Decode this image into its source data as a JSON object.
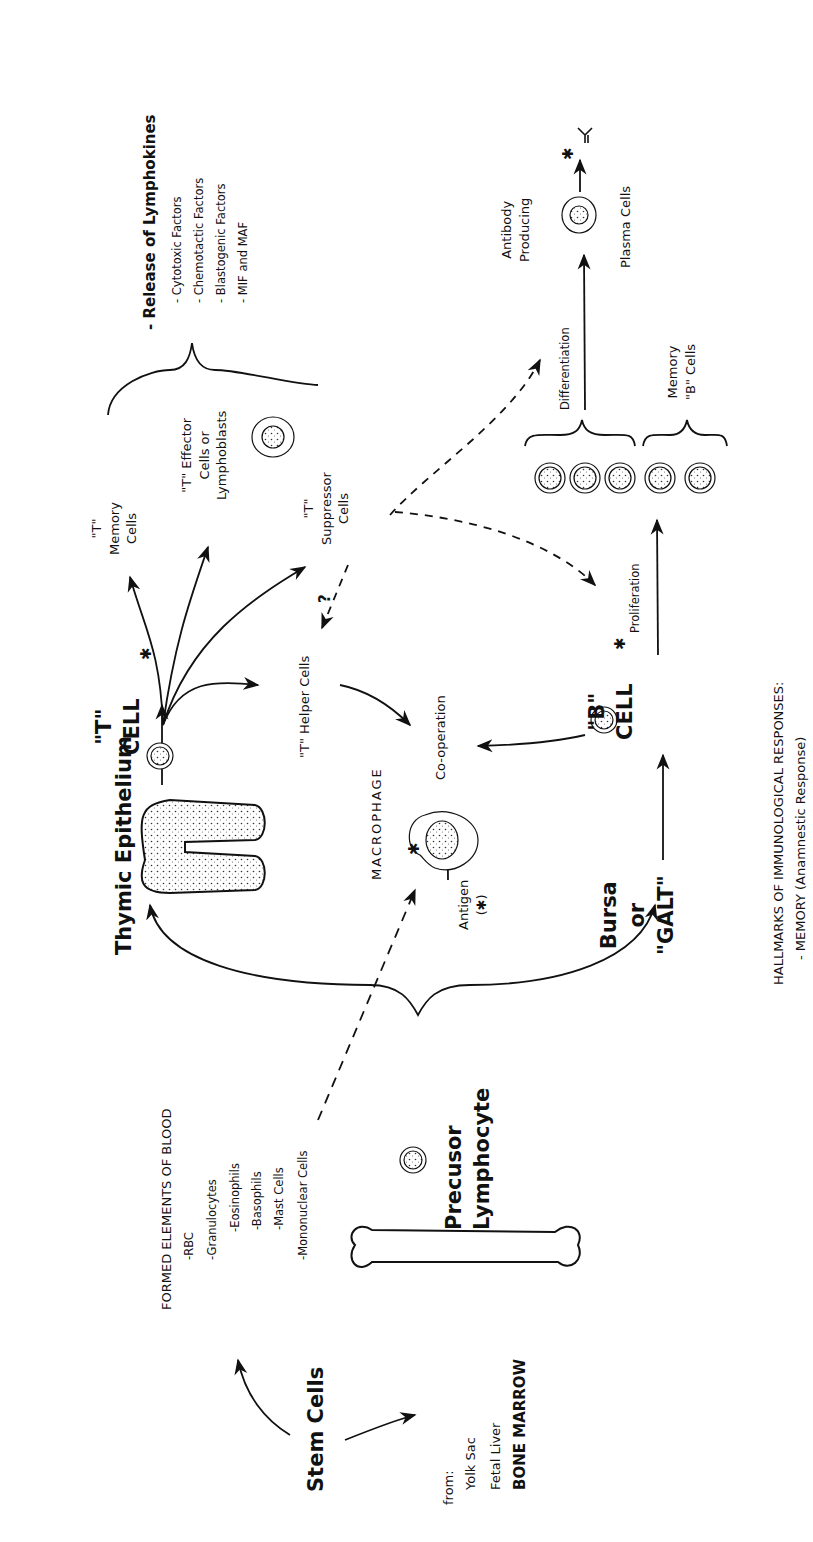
{
  "diagram": {
    "title": "HALLMARKS OF IMMUNOLOGICAL RESPONSES:",
    "subtitle": "- MEMORY (Anamnestic Response)",
    "orientation": "rotated 90° counterclockwise",
    "nodes": {
      "stem_cells": "Stem Cells",
      "stem_sources": {
        "heading": "from:",
        "items": [
          "Yolk Sac",
          "Fetal Liver",
          "BONE MARROW"
        ]
      },
      "formed_elements": {
        "heading": "FORMED ELEMENTS OF BLOOD",
        "items": [
          "-RBC",
          "-Granulocytes",
          "-Eosinophils",
          "-Basophils",
          "-Mast Cells",
          "-Mononuclear Cells"
        ]
      },
      "precursor": "Precusor\nLymphocyte",
      "thymic": "Thymic Epithelium",
      "bursa": "Bursa\nor\n\"GALT\"",
      "macrophage": "MACROPHAGE",
      "antigen": "Antigen\n(✱)",
      "t_cell": "\"T\"\nCELL",
      "b_cell": "\"B\"\nCELL",
      "t_memory": "\"T\"\nMemory\nCells",
      "t_effector": "\"T\" Effector\nCells or\nLymphoblasts",
      "t_suppressor": "\"T\"\nSuppressor\nCells",
      "t_helper": "\"T\" Helper Cells",
      "question": "?",
      "cooperation": "Co-operation",
      "proliferation": "Proliferation",
      "differentiation": "Differentiation",
      "memory_b": "Memory\n\"B\" Cells",
      "antibody_producing": "Antibody\nProducing",
      "plasma_cells": "Plasma Cells",
      "lymphokines": {
        "heading": "- Release of Lymphokines",
        "items": [
          "- Cytotoxic Factors",
          "- Chemotactic Factors",
          "- Blastogenic Factors",
          "- MIF and MAF"
        ]
      },
      "asterisk": "✱"
    },
    "edges": [
      {
        "from": "Stem Cells",
        "to": "FORMED ELEMENTS OF BLOOD",
        "style": "solid"
      },
      {
        "from": "Stem Cells",
        "to": "Bone Marrow",
        "style": "solid"
      },
      {
        "from": "Precusor Lymphocyte",
        "to": "Thymic Epithelium",
        "style": "solid"
      },
      {
        "from": "Precusor Lymphocyte",
        "to": "Bursa or GALT",
        "style": "solid"
      },
      {
        "from": "Mononuclear Cells",
        "to": "MACROPHAGE",
        "style": "dashed"
      },
      {
        "from": "Thymic Epithelium",
        "to": "T CELL",
        "style": "solid"
      },
      {
        "from": "Bursa or GALT",
        "to": "B CELL",
        "style": "solid"
      },
      {
        "from": "T CELL",
        "to": "T Memory Cells",
        "style": "solid"
      },
      {
        "from": "T CELL",
        "to": "T Effector Cells",
        "style": "solid"
      },
      {
        "from": "T CELL",
        "to": "T Suppressor Cells",
        "style": "solid"
      },
      {
        "from": "T CELL",
        "to": "T Helper Cells",
        "style": "solid"
      },
      {
        "from": "T Suppressor Cells",
        "to": "T Helper Cells",
        "style": "dashed",
        "label": "?"
      },
      {
        "from": "T Suppressor Cells",
        "to": "Differentiation",
        "style": "dashed"
      },
      {
        "from": "T Suppressor Cells",
        "to": "Proliferation",
        "style": "dashed"
      },
      {
        "from": "T Helper Cells",
        "to": "Co-operation",
        "style": "solid"
      },
      {
        "from": "MACROPHAGE",
        "to": "Co-operation",
        "style": "solid"
      },
      {
        "from": "B CELL",
        "to": "Co-operation",
        "style": "solid"
      },
      {
        "from": "B CELL",
        "to": "proliferated cells",
        "style": "solid",
        "label": "Proliferation"
      },
      {
        "from": "proliferated cells",
        "to": "Plasma Cells",
        "style": "solid",
        "label": "Differentiation"
      },
      {
        "from": "Plasma Cells",
        "to": "Antibody",
        "style": "solid"
      }
    ]
  }
}
